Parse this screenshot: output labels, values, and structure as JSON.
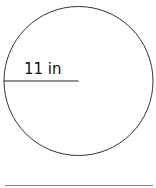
{
  "diagram": {
    "shape": "circle",
    "radius_label": "11 in",
    "stroke_color": "#333333",
    "baseline_color": "#888888"
  }
}
